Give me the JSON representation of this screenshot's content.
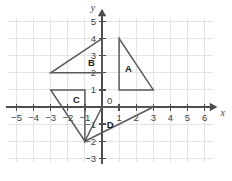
{
  "chart_data": {
    "type": "scatter",
    "title": "",
    "xlabel": "x",
    "ylabel": "y",
    "xlim": [
      -5.6,
      6.6
    ],
    "ylim": [
      -3.4,
      5.5
    ],
    "grid": true,
    "legend": "none",
    "x_ticks": [
      -5,
      -4,
      -3,
      -2,
      -1,
      0,
      1,
      2,
      3,
      4,
      5,
      6
    ],
    "y_ticks": [
      -3,
      -2,
      -1,
      0,
      1,
      2,
      3,
      4,
      5
    ],
    "origin_label": "0",
    "shapes": [
      {
        "name": "A",
        "label": "A",
        "label_pos": [
          1.55,
          2.25
        ],
        "vertices": [
          [
            1,
            4
          ],
          [
            1,
            1
          ],
          [
            3,
            1
          ]
        ]
      },
      {
        "name": "B",
        "label": "B",
        "label_pos": [
          -0.62,
          2.62
        ],
        "vertices": [
          [
            0,
            4
          ],
          [
            0,
            2
          ],
          [
            -3,
            2
          ]
        ]
      },
      {
        "name": "C",
        "label": "C",
        "label_pos": [
          -1.5,
          0.45
        ],
        "vertices": [
          [
            -3,
            1
          ],
          [
            -1,
            1
          ],
          [
            -1,
            -2
          ]
        ]
      },
      {
        "name": "D",
        "label": "D",
        "label_pos": [
          0.48,
          -1.02
        ],
        "vertices": [
          [
            0,
            0
          ],
          [
            3,
            0
          ],
          [
            -1,
            -2
          ]
        ]
      }
    ]
  },
  "axes": {
    "x_name": "x",
    "y_name": "y"
  }
}
